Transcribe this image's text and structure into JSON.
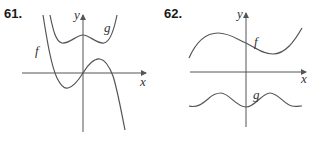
{
  "panels": [
    {
      "number": "61.",
      "number_pos": [
        4,
        18
      ],
      "axes": {
        "origin": [
          83,
          73
        ],
        "x_range": [
          22,
          146
        ],
        "y_range": [
          15,
          132
        ],
        "x_label": "x",
        "x_label_pos": [
          140,
          86
        ],
        "y_label": "y",
        "y_label_pos": [
          74,
          19
        ]
      },
      "curves": [
        {
          "name": "f",
          "label_pos": [
            35,
            55
          ],
          "path": "M 43 15 C 47 40, 51 65, 57 78 C 61 86, 65 89, 68 88 C 73 87, 78 81, 83 73 C 88 64, 95 58, 100 59 C 106 60, 110 68, 113 76 C 117 88, 121 110, 125 130"
        },
        {
          "name": "g",
          "label_pos": [
            104,
            32
          ],
          "path": "M 50 15 C 53 30, 56 42, 62 43 C 70 44, 76 35, 83 35 C 90 35, 96 44, 104 43 C 110 42, 114 30, 117 15"
        }
      ]
    },
    {
      "number": "62.",
      "number_pos": [
        164,
        18
      ],
      "axes": {
        "origin": [
          246,
          72
        ],
        "x_range": [
          190,
          306
        ],
        "y_range": [
          13,
          127
        ],
        "x_label": "x",
        "x_label_pos": [
          301,
          83
        ],
        "y_label": "y",
        "y_label_pos": [
          237,
          18
        ]
      },
      "curves": [
        {
          "name": "f",
          "label_pos": [
            254,
            46
          ],
          "path": "M 189 58 C 197 40, 208 33, 218 33 C 230 33, 238 40, 246 43 C 256 48, 263 54, 273 54 C 285 54, 294 42, 302 28"
        },
        {
          "name": "g",
          "label_pos": [
            253,
            99
          ],
          "path": "M 189 106 C 197 108, 202 104, 208 99 C 213 94, 217 93, 221 93 C 229 93, 236 107, 246 107 C 255 107, 262 93, 270 93 C 278 93, 285 105, 292 106 C 296 107, 299 106, 302 106"
        }
      ]
    }
  ]
}
